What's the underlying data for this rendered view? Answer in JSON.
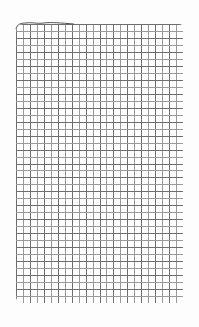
{
  "scene": {
    "description": "Sheet of square-grid graph paper on white background",
    "background_color": "#ffffff"
  },
  "paper": {
    "color": "#ffffff",
    "grid_line_color": "#6e6e6e",
    "grid_line_light_color": "#9a9a9a",
    "columns": 24,
    "rows": 40,
    "cell_size_px": 6.95
  }
}
